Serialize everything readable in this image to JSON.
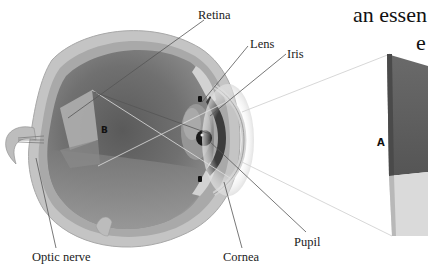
{
  "diagram": {
    "title_fragment": "an essen",
    "title_fragment_line2": "e",
    "labels": {
      "retina": "Retina",
      "lens": "Lens",
      "iris": "Iris",
      "pupil": "Pupil",
      "cornea": "Cornea",
      "optic_nerve": "Optic nerve"
    },
    "markers": {
      "image_on_retina": "B",
      "object": "A"
    },
    "colors": {
      "eye_interior": "#6e6e6e",
      "eye_wall": "#b8b8b8",
      "object_dark": "#5f5f5f",
      "object_light": "#d9d9d9",
      "leader_line": "#555555",
      "projection_line": "#cfcfcf"
    }
  }
}
